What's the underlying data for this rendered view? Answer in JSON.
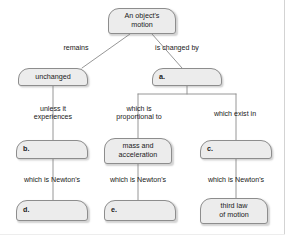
{
  "diagram": {
    "type": "concept-map",
    "colors": {
      "node_fill": "#ececec",
      "node_border": "#8d8d8d",
      "connector": "#8a8a8a",
      "text": "#1b1b1b",
      "background": "#ffffff"
    },
    "nodes": [
      {
        "id": "root",
        "label": "An object's\nmotion",
        "x": 108,
        "y": 8,
        "w": 68,
        "h": 26,
        "blank": false
      },
      {
        "id": "unchanged",
        "label": "unchanged",
        "x": 18,
        "y": 68,
        "w": 70,
        "h": 18,
        "blank": false
      },
      {
        "id": "a",
        "label": "a.",
        "x": 152,
        "y": 68,
        "w": 70,
        "h": 18,
        "blank": true
      },
      {
        "id": "b",
        "label": "b.",
        "x": 16,
        "y": 140,
        "w": 72,
        "h": 19,
        "blank": true
      },
      {
        "id": "mass",
        "label": "mass and\nacceleration",
        "x": 104,
        "y": 138,
        "w": 68,
        "h": 26,
        "blank": false
      },
      {
        "id": "c",
        "label": "c.",
        "x": 200,
        "y": 140,
        "w": 72,
        "h": 19,
        "blank": true
      },
      {
        "id": "d",
        "label": "d.",
        "x": 16,
        "y": 200,
        "w": 72,
        "h": 21,
        "blank": true
      },
      {
        "id": "e",
        "label": "e.",
        "x": 104,
        "y": 200,
        "w": 72,
        "h": 21,
        "blank": true
      },
      {
        "id": "thirdlaw",
        "label": "third law\nof motion",
        "x": 200,
        "y": 198,
        "w": 68,
        "h": 26,
        "blank": false
      }
    ],
    "edge_labels": [
      {
        "id": "remains",
        "text": "remains",
        "x": 48,
        "y": 44,
        "w": 56
      },
      {
        "id": "is-changed-by",
        "text": "is changed by",
        "x": 144,
        "y": 44,
        "w": 66
      },
      {
        "id": "unless-it",
        "text": "unless it\nexperiences",
        "x": 24,
        "y": 105,
        "w": 58
      },
      {
        "id": "proportional",
        "text": "which is\nproportional to",
        "x": 108,
        "y": 105,
        "w": 62
      },
      {
        "id": "which-exist-in",
        "text": "which exist in",
        "x": 204,
        "y": 110,
        "w": 62
      },
      {
        "id": "newtons-left",
        "text": "which is Newton's",
        "x": 14,
        "y": 176,
        "w": 76
      },
      {
        "id": "newtons-mid",
        "text": "which is Newton's",
        "x": 100,
        "y": 176,
        "w": 76
      },
      {
        "id": "newtons-right",
        "text": "which is Newton's",
        "x": 198,
        "y": 176,
        "w": 76
      }
    ],
    "connectors": [
      {
        "id": "root-to-remains",
        "d": "M 130 34 L 82 68"
      },
      {
        "id": "root-to-changedby",
        "d": "M 152 34 L 182 68"
      },
      {
        "id": "unchanged-to-b",
        "d": "M 53 86 L 53 140"
      },
      {
        "id": "a-branch-trunk",
        "d": "M 187 86 L 187 94"
      },
      {
        "id": "a-branch-horizontal",
        "d": "M 138 94 L 236 94"
      },
      {
        "id": "a-branch-left-drop",
        "d": "M 138 94 L 138 138"
      },
      {
        "id": "a-branch-right-drop",
        "d": "M 236 94 L 236 140"
      },
      {
        "id": "b-to-d",
        "d": "M 53 159 L 53 200"
      },
      {
        "id": "mass-to-e",
        "d": "M 138 164 L 138 200"
      },
      {
        "id": "c-to-thirdlaw",
        "d": "M 236 159 L 236 198"
      }
    ]
  }
}
